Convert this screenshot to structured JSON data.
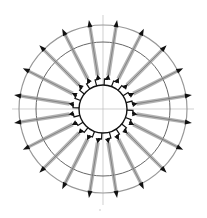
{
  "diagram": {
    "type": "radial-field",
    "center": [
      103,
      109
    ],
    "inner_radius": 24,
    "step_radius": 30,
    "middle_radius": 67,
    "outer_radius": 84,
    "arrow_count": 20,
    "arrow_start_angle_deg": 9,
    "arrow_tip_radius": 90,
    "axis_extent": {
      "left": 12,
      "right": 194,
      "top": 15,
      "bottom": 205
    },
    "colors": {
      "ink": "#111111",
      "shaft": "#9a9a9a",
      "ring": "#555555",
      "axis": "#bbbbbb"
    }
  }
}
